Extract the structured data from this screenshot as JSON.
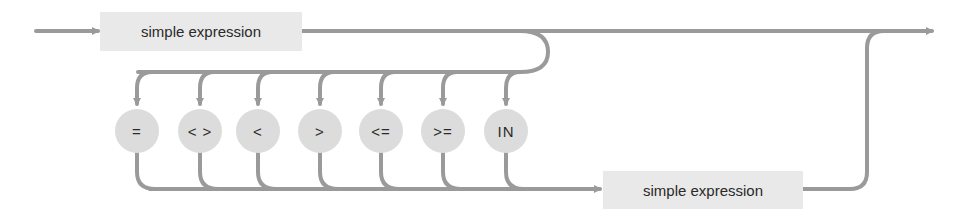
{
  "diagram": {
    "type": "syntax-diagram",
    "top_box": {
      "label": "simple expression"
    },
    "bottom_box": {
      "label": "simple expression"
    },
    "operators": [
      {
        "symbol": "=",
        "name": "equal"
      },
      {
        "symbol": "< >",
        "name": "not-equal"
      },
      {
        "symbol": "<",
        "name": "less-than"
      },
      {
        "symbol": ">",
        "name": "greater-than"
      },
      {
        "symbol": "<=",
        "name": "less-or-equal"
      },
      {
        "symbol": ">=",
        "name": "greater-or-equal"
      },
      {
        "symbol": "IN",
        "name": "in"
      }
    ],
    "colors": {
      "line": "#9a9a9a",
      "box_fill": "#e9e9e9",
      "circle_fill": "#dcdcdc",
      "text": "#2a2a2a"
    }
  }
}
